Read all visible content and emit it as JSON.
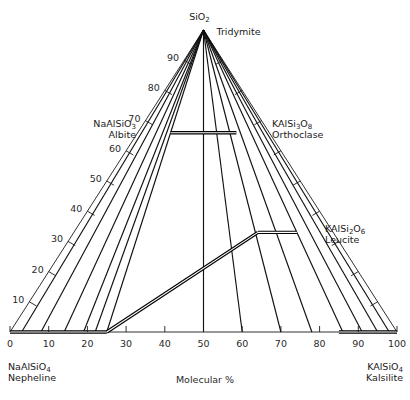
{
  "figure": {
    "axis_caption": "Molecular %",
    "background_color": "#ffffff",
    "line_color": "#111111"
  },
  "corners": {
    "apex": {
      "formula_main": "SiO",
      "formula_sub": "2",
      "mineral": "Tridymite"
    },
    "bottom_left": {
      "formula_main": "NaAlSiO",
      "formula_sub": "4",
      "mineral": "Nepheline"
    },
    "bottom_right": {
      "formula_main": "KAlSiO",
      "formula_sub": "4",
      "mineral": "Kalsilite"
    }
  },
  "phases": [
    {
      "id": "albite",
      "formula_parts": [
        "NaAlSiO",
        "3"
      ],
      "mineral": "Albite",
      "side": "left"
    },
    {
      "id": "orthoclase",
      "formula_parts": [
        "KAlSi",
        "3",
        "O",
        "8"
      ],
      "mineral": "Orthoclase",
      "side": "right"
    },
    {
      "id": "leucite",
      "formula_parts": [
        "KAlSi",
        "2",
        "O",
        "6"
      ],
      "mineral": "Leucite",
      "side": "right"
    }
  ],
  "axes": {
    "bottom": {
      "label": "Molecular %",
      "ticks": [
        0,
        10,
        20,
        30,
        40,
        50,
        60,
        70,
        80,
        90,
        100
      ]
    },
    "left": {
      "ticks": [
        10,
        20,
        30,
        40,
        50,
        60,
        70,
        80,
        90
      ]
    },
    "right": {
      "ticks": [
        10,
        20,
        30,
        40,
        50,
        60,
        70,
        80,
        90
      ]
    }
  },
  "chart_data": {
    "type": "scatter",
    "xlabel": "Molecular %",
    "ylabel": "",
    "grid": true,
    "legend": false,
    "vertices": {
      "left": "NaAlSiO4 Nepheline",
      "right": "KAlSiO4 Kalsilite",
      "top": "SiO2 Tridymite"
    },
    "xlim": [
      0,
      100
    ],
    "bottom_ticks": [
      0,
      10,
      20,
      30,
      40,
      50,
      60,
      70,
      80,
      90,
      100
    ],
    "left_ticks": [
      10,
      20,
      30,
      40,
      50,
      60,
      70,
      80,
      90
    ],
    "right_ticks": [
      10,
      20,
      30,
      40,
      50,
      60,
      70,
      80,
      90
    ],
    "phase_joins": [
      {
        "name": "Albite-Orthoclase join",
        "from": {
          "x": 25.0,
          "silica": 66.0
        },
        "to": {
          "x": 75.0,
          "silica": 66.0
        }
      },
      {
        "name": "Nepheline-Leucite join",
        "from": {
          "x": 25.0,
          "silica": 0.0
        },
        "to": {
          "x": 71.0,
          "silica": 33.0
        }
      },
      {
        "name": "Leucite-Orthoclase join",
        "from": {
          "x": 71.0,
          "silica": 33.0
        },
        "to": {
          "x": 86.0,
          "silica": 33.0
        }
      },
      {
        "name": "Nepheline field base",
        "from": {
          "x": 0.0,
          "silica": 0.0
        },
        "to": {
          "x": 25.0,
          "silica": 0.0
        }
      },
      {
        "name": "Kalsilite field base",
        "from": {
          "x": 85.0,
          "silica": 0.0
        },
        "to": {
          "x": 100.0,
          "silica": 0.0
        }
      }
    ],
    "tridymite_rays": [
      {
        "base_x": 3
      },
      {
        "base_x": 8
      },
      {
        "base_x": 14
      },
      {
        "base_x": 19
      },
      {
        "base_x": 22
      },
      {
        "base_x": 25
      },
      {
        "base_x": 50
      },
      {
        "base_x": 60
      },
      {
        "base_x": 70
      },
      {
        "base_x": 78
      },
      {
        "base_x": 86
      },
      {
        "base_x": 91
      },
      {
        "base_x": 95
      },
      {
        "base_x": 98
      }
    ]
  }
}
